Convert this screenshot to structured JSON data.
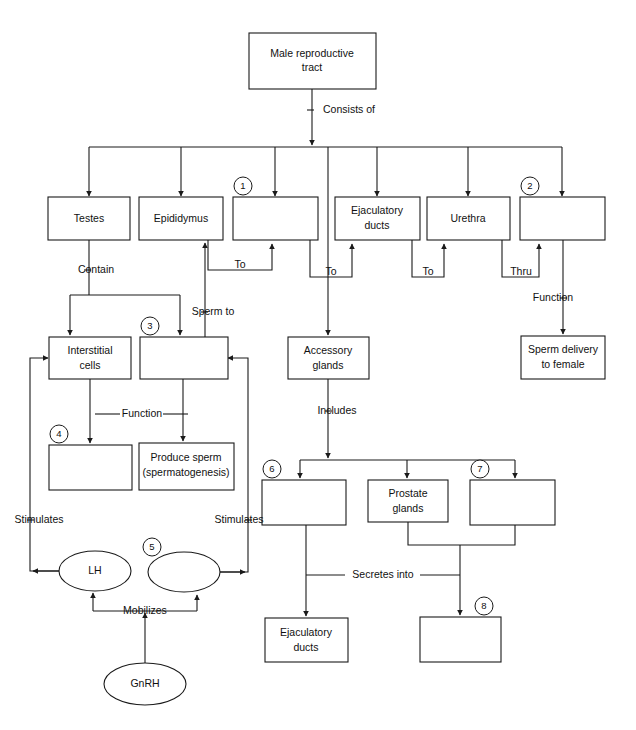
{
  "diagram": {
    "type": "flowchart",
    "line_color": "#1a1a1a",
    "fill_color": "#ffffff",
    "nodes": [
      {
        "id": "root",
        "label": "Male reproductive\ntract",
        "shape": "box"
      },
      {
        "id": "testes",
        "label": "Testes",
        "shape": "box"
      },
      {
        "id": "epididymus",
        "label": "Epididymus",
        "shape": "box"
      },
      {
        "id": "blank1",
        "label": "",
        "shape": "box",
        "marker": "1"
      },
      {
        "id": "ejac_ducts_top",
        "label": "Ejaculatory\nducts",
        "shape": "box"
      },
      {
        "id": "urethra",
        "label": "Urethra",
        "shape": "box"
      },
      {
        "id": "blank2",
        "label": "",
        "shape": "box",
        "marker": "2"
      },
      {
        "id": "interstitial",
        "label": "Interstitial\ncells",
        "shape": "box"
      },
      {
        "id": "blank3",
        "label": "",
        "shape": "box",
        "marker": "3"
      },
      {
        "id": "accessory",
        "label": "Accessory\nglands",
        "shape": "box"
      },
      {
        "id": "sperm_delivery",
        "label": "Sperm delivery\nto female",
        "shape": "box"
      },
      {
        "id": "blank4",
        "label": "",
        "shape": "box",
        "marker": "4"
      },
      {
        "id": "produce_sperm",
        "label": "Produce sperm\n(spermatogenesis)",
        "shape": "box"
      },
      {
        "id": "blank6",
        "label": "",
        "shape": "box",
        "marker": "6"
      },
      {
        "id": "prostate",
        "label": "Prostate\nglands",
        "shape": "box"
      },
      {
        "id": "blank7",
        "label": "",
        "shape": "box",
        "marker": "7"
      },
      {
        "id": "lh",
        "label": "LH",
        "shape": "ellipse"
      },
      {
        "id": "blank5",
        "label": "",
        "shape": "ellipse",
        "marker": "5"
      },
      {
        "id": "gnrh",
        "label": "GnRH",
        "shape": "ellipse"
      },
      {
        "id": "ejac_ducts_bot",
        "label": "Ejaculatory\nducts",
        "shape": "box"
      },
      {
        "id": "blank8",
        "label": "",
        "shape": "box",
        "marker": "8"
      }
    ],
    "edge_labels": [
      {
        "id": "consists_of",
        "text": "Consists of"
      },
      {
        "id": "contain",
        "text": "Contain"
      },
      {
        "id": "to_1",
        "text": "To"
      },
      {
        "id": "to_2",
        "text": "To"
      },
      {
        "id": "to_3",
        "text": "To"
      },
      {
        "id": "thru",
        "text": "Thru"
      },
      {
        "id": "sperm_to",
        "text": "Sperm to"
      },
      {
        "id": "function_left",
        "text": "Function"
      },
      {
        "id": "function_right",
        "text": "Function"
      },
      {
        "id": "includes",
        "text": "Includes"
      },
      {
        "id": "stimulates_l",
        "text": "Stimulates"
      },
      {
        "id": "stimulates_r",
        "text": "Stimulates"
      },
      {
        "id": "mobilizes",
        "text": "Mobilizes"
      },
      {
        "id": "secretes_into",
        "text": "Secretes into"
      }
    ],
    "blank_markers": [
      "1",
      "2",
      "3",
      "4",
      "5",
      "6",
      "7",
      "8"
    ]
  }
}
